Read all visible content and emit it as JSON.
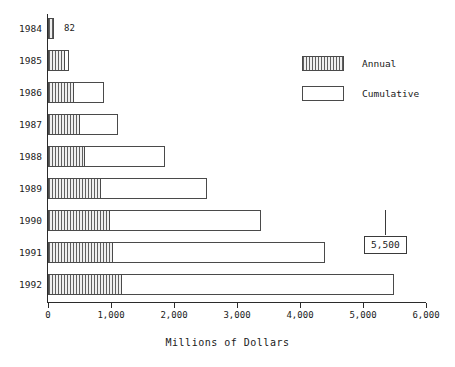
{
  "chart_data": {
    "type": "bar",
    "orientation": "horizontal",
    "stacked": true,
    "title": "",
    "xlabel": "Millions of Dollars",
    "ylabel": "",
    "xlim": [
      0,
      6000
    ],
    "xticks": [
      0,
      1000,
      2000,
      3000,
      4000,
      5000,
      6000
    ],
    "xtick_labels": [
      "0",
      "1,000",
      "2,000",
      "3,000",
      "4,000",
      "5,000",
      "6,000"
    ],
    "categories": [
      "1984",
      "1985",
      "1986",
      "1987",
      "1988",
      "1989",
      "1990",
      "1991",
      "1992"
    ],
    "series": [
      {
        "name": "Annual",
        "values": [
          82,
          270,
          410,
          510,
          590,
          840,
          980,
          1030,
          1170
        ]
      },
      {
        "name": "Cumulative",
        "values": [
          0,
          60,
          480,
          600,
          1270,
          1680,
          2400,
          3370,
          4330
        ],
        "note": "segment drawn after the Annual segment; cumulative totals are 82, 330, 890, 1110, 1860, 2520, 3380, 4400, 5500"
      }
    ],
    "cumulative_totals": [
      82,
      330,
      890,
      1110,
      1860,
      2520,
      3380,
      4400,
      5500
    ],
    "grid": false,
    "legend_position": "upper right",
    "annotations": [
      {
        "name": "first-bar-value",
        "text": "82",
        "target": "1984"
      },
      {
        "name": "last-bar-callout",
        "text": "5,500",
        "target": "1992"
      }
    ]
  },
  "legend": {
    "items": [
      {
        "label": "Annual",
        "swatch": "hatched-swatch"
      },
      {
        "label": "Cumulative",
        "swatch": "white-swatch"
      }
    ]
  },
  "axis": {
    "x_title": "Millions of Dollars"
  },
  "colors": {
    "axis": "#2b2b2b",
    "bar_outline": "#4a4a4a",
    "annual_fill": "#e9e9e9",
    "cumulative_fill": "#ffffff",
    "text": "#1a1a1a"
  }
}
